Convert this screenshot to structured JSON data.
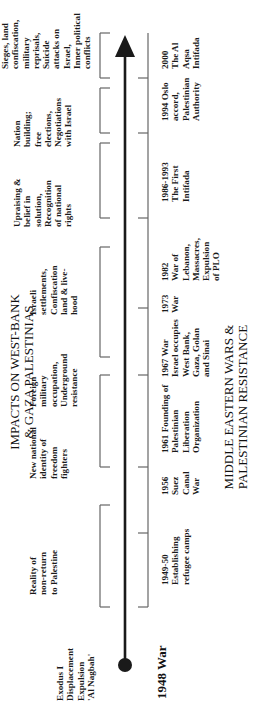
{
  "diagram": {
    "type": "timeline",
    "orientation": "rotated-ccw",
    "top_caption": [
      "IMPACTS ON WEST-BANK",
      "& GAZA PALESTINIAS"
    ],
    "bottom_caption": [
      "MIDDLE EASTERN WARS &",
      "PALESTINIAN RESISTANCE"
    ],
    "start_event": "1948 War",
    "start_impact": [
      "Exodus I",
      "Displacement",
      "Expulsion",
      "'Al Nagbah'"
    ],
    "impacts": [
      {
        "lines": [
          "Reality of",
          "non-return",
          "to Palestine"
        ]
      },
      {
        "lines": [
          "New national",
          "identity of",
          "freedom",
          "fighters"
        ]
      },
      {
        "lines": [
          "Foreign",
          "military",
          "occupation,",
          "Underground",
          "resistance"
        ]
      },
      {
        "lines": [
          "Israeli",
          "settlements,",
          "Confiscation",
          "land & live-",
          "hood"
        ]
      },
      {
        "lines": [
          "Upraising &",
          "belief in",
          "solution,",
          "Recognition",
          "of national",
          "rights"
        ]
      },
      {
        "lines": [
          "Nation",
          "building;",
          "free",
          "elections,",
          "Negotiations",
          "with Israel"
        ]
      },
      {
        "lines": [
          "Sieges, land",
          "confiscation,",
          "military",
          "reprisals,",
          "Suicide",
          "attacks on",
          "Israel,",
          "Inner political",
          "conflicts"
        ]
      }
    ],
    "events": [
      {
        "lines": [
          "1949-50",
          "Establishing",
          "refugee camps"
        ]
      },
      {
        "lines": [
          "1956",
          "Suez",
          "Canal",
          "War"
        ]
      },
      {
        "lines": [
          "1961 Founding of",
          "Palestinian",
          "Liberation",
          "Organization"
        ]
      },
      {
        "lines": [
          "1967 War",
          "Israel occupies",
          "West Bank,",
          "Gaza, Golan",
          "and Sinai"
        ]
      },
      {
        "lines": [
          "1973",
          "War"
        ]
      },
      {
        "lines": [
          "1982",
          "War of",
          "Lebanon,",
          "Massacres,",
          "Expulsion",
          "of PLO"
        ]
      },
      {
        "lines": [
          "1986-1993",
          "The First",
          "Intifada"
        ]
      },
      {
        "lines": [
          "1994 Oslo",
          "accord,",
          "Palestinian",
          "Authority"
        ]
      },
      {
        "lines": [
          "2000",
          "The Al",
          "Aqsa",
          "Intifada"
        ]
      }
    ],
    "colors": {
      "line": "#1a1a1a",
      "bracket": "#666666",
      "text": "#111111"
    }
  }
}
